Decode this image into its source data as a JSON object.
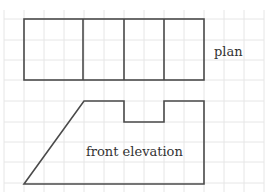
{
  "diagram": {
    "type": "orthographic-projection",
    "labels": {
      "plan": "plan",
      "front_elevation": "front elevation"
    },
    "colors": {
      "background": "#ffffff",
      "grid": "#e6e6e6",
      "outline": "#4a4a4a",
      "text": "#333333"
    },
    "grid": {
      "spacing_px": 20,
      "x_lines": [
        4,
        24,
        44,
        64,
        84,
        104,
        124,
        144,
        164,
        184,
        204,
        224,
        244,
        264
      ],
      "y_lines": [
        19,
        40,
        60,
        80,
        101,
        122,
        142,
        162,
        183
      ]
    },
    "plan": {
      "rect": {
        "x": 24,
        "y": 19,
        "width": 180,
        "height": 61
      },
      "dividers_x": [
        83,
        124,
        164
      ]
    },
    "front_elevation": {
      "points": [
        [
          24,
          184
        ],
        [
          84,
          101
        ],
        [
          124,
          101
        ],
        [
          124,
          122
        ],
        [
          164,
          122
        ],
        [
          164,
          101
        ],
        [
          204,
          101
        ],
        [
          204,
          184
        ]
      ]
    }
  }
}
